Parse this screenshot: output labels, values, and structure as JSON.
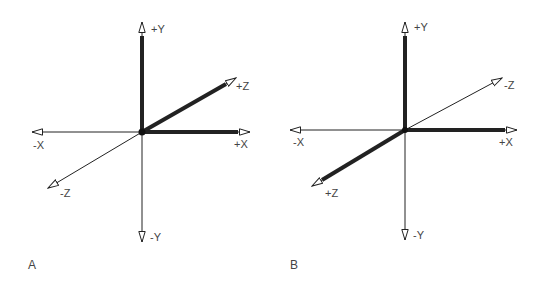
{
  "diagrams": [
    {
      "id": "A",
      "label": "A",
      "axes": {
        "pos_y": {
          "label": "+Y",
          "emphasis": "thick"
        },
        "neg_y": {
          "label": "-Y",
          "emphasis": "thin"
        },
        "pos_x": {
          "label": "+X",
          "emphasis": "thick"
        },
        "neg_x": {
          "label": "-X",
          "emphasis": "thin"
        },
        "pos_z": {
          "label": "+Z",
          "emphasis": "thick",
          "direction": "up-right (into screen)"
        },
        "neg_z": {
          "label": "-Z",
          "emphasis": "thin",
          "direction": "down-left"
        }
      }
    },
    {
      "id": "B",
      "label": "B",
      "axes": {
        "pos_y": {
          "label": "+Y",
          "emphasis": "thick"
        },
        "neg_y": {
          "label": "-Y",
          "emphasis": "thin"
        },
        "pos_x": {
          "label": "+X",
          "emphasis": "thick"
        },
        "neg_x": {
          "label": "-X",
          "emphasis": "thin"
        },
        "pos_z": {
          "label": "+Z",
          "emphasis": "thick",
          "direction": "down-left (out of screen)"
        },
        "neg_z": {
          "label": "-Z",
          "emphasis": "thin",
          "direction": "up-right"
        }
      }
    }
  ],
  "colors": {
    "line": "#222222",
    "arrow_fill": "#ffffff",
    "text": "#444444"
  }
}
